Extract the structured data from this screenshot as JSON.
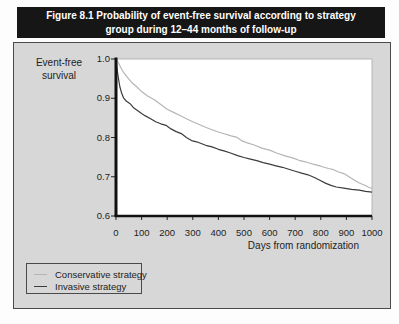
{
  "figure": {
    "title_lines": [
      "Figure 8.1 Probability of event-free survival according to strategy",
      "group during 12–44 months of follow-up"
    ]
  },
  "axes": {
    "y_title": "Event-free\nsurvival",
    "x_title": "Days from randomization",
    "y_tick_labels": [
      "1.0",
      "0.9",
      "0.8",
      "0.7",
      "0.6"
    ],
    "x_tick_labels": [
      "0",
      "100",
      "200",
      "300",
      "400",
      "500",
      "600",
      "700",
      "800",
      "900",
      "1000"
    ]
  },
  "legend": {
    "items": [
      {
        "label": "Conservative strategy",
        "color": "#b5b5b5"
      },
      {
        "label": "Invasive strategy",
        "color": "#3c3c3c"
      }
    ]
  },
  "colors": {
    "title_bar_bg": "#161616",
    "title_bar_text": "#ffffff",
    "panel_bg": "#d7d7d7",
    "plot_bg": "#ffffff",
    "axis": "#111111",
    "plot_frame": "#b0b0b0"
  },
  "chart_data": {
    "type": "line",
    "title": "Figure 8.1 Probability of event-free survival according to strategy group during 12–44 months of follow-up",
    "xlabel": "Days from randomization",
    "ylabel": "Event-free survival",
    "xlim": [
      0,
      1000
    ],
    "ylim": [
      0.6,
      1.0
    ],
    "x_ticks": [
      0,
      100,
      200,
      300,
      400,
      500,
      600,
      700,
      800,
      900,
      1000
    ],
    "y_ticks": [
      1.0,
      0.9,
      0.8,
      0.7,
      0.6
    ],
    "grid": false,
    "legend_position": "bottom-left-outside",
    "series": [
      {
        "name": "Conservative strategy",
        "color": "#b5b5b5",
        "points": [
          [
            0,
            1.0
          ],
          [
            8,
            0.992
          ],
          [
            18,
            0.979
          ],
          [
            30,
            0.965
          ],
          [
            45,
            0.953
          ],
          [
            60,
            0.941
          ],
          [
            80,
            0.93
          ],
          [
            100,
            0.917
          ],
          [
            125,
            0.905
          ],
          [
            150,
            0.896
          ],
          [
            175,
            0.884
          ],
          [
            200,
            0.872
          ],
          [
            225,
            0.864
          ],
          [
            250,
            0.856
          ],
          [
            275,
            0.848
          ],
          [
            300,
            0.84
          ],
          [
            325,
            0.833
          ],
          [
            350,
            0.826
          ],
          [
            375,
            0.82
          ],
          [
            400,
            0.814
          ],
          [
            425,
            0.809
          ],
          [
            450,
            0.804
          ],
          [
            470,
            0.801
          ],
          [
            490,
            0.792
          ],
          [
            510,
            0.787
          ],
          [
            540,
            0.781
          ],
          [
            570,
            0.773
          ],
          [
            600,
            0.768
          ],
          [
            630,
            0.76
          ],
          [
            660,
            0.753
          ],
          [
            690,
            0.748
          ],
          [
            715,
            0.742
          ],
          [
            740,
            0.738
          ],
          [
            770,
            0.732
          ],
          [
            800,
            0.727
          ],
          [
            830,
            0.721
          ],
          [
            850,
            0.718
          ],
          [
            870,
            0.712
          ],
          [
            890,
            0.708
          ],
          [
            910,
            0.7
          ],
          [
            930,
            0.692
          ],
          [
            950,
            0.684
          ],
          [
            970,
            0.679
          ],
          [
            985,
            0.674
          ],
          [
            1000,
            0.67
          ]
        ]
      },
      {
        "name": "Invasive strategy",
        "color": "#3c3c3c",
        "points": [
          [
            0,
            1.0
          ],
          [
            5,
            0.97
          ],
          [
            10,
            0.948
          ],
          [
            15,
            0.93
          ],
          [
            22,
            0.913
          ],
          [
            30,
            0.9
          ],
          [
            40,
            0.893
          ],
          [
            55,
            0.886
          ],
          [
            70,
            0.875
          ],
          [
            85,
            0.868
          ],
          [
            100,
            0.861
          ],
          [
            115,
            0.855
          ],
          [
            135,
            0.848
          ],
          [
            155,
            0.84
          ],
          [
            175,
            0.835
          ],
          [
            195,
            0.831
          ],
          [
            215,
            0.822
          ],
          [
            235,
            0.815
          ],
          [
            255,
            0.81
          ],
          [
            275,
            0.8
          ],
          [
            295,
            0.792
          ],
          [
            315,
            0.789
          ],
          [
            335,
            0.784
          ],
          [
            355,
            0.779
          ],
          [
            375,
            0.776
          ],
          [
            400,
            0.77
          ],
          [
            425,
            0.765
          ],
          [
            450,
            0.76
          ],
          [
            475,
            0.754
          ],
          [
            500,
            0.749
          ],
          [
            525,
            0.745
          ],
          [
            550,
            0.741
          ],
          [
            575,
            0.736
          ],
          [
            600,
            0.732
          ],
          [
            625,
            0.728
          ],
          [
            650,
            0.724
          ],
          [
            675,
            0.719
          ],
          [
            700,
            0.714
          ],
          [
            725,
            0.709
          ],
          [
            750,
            0.705
          ],
          [
            775,
            0.698
          ],
          [
            800,
            0.69
          ],
          [
            820,
            0.683
          ],
          [
            840,
            0.678
          ],
          [
            860,
            0.674
          ],
          [
            890,
            0.671
          ],
          [
            920,
            0.668
          ],
          [
            950,
            0.666
          ],
          [
            975,
            0.663
          ],
          [
            1000,
            0.661
          ]
        ]
      }
    ]
  }
}
